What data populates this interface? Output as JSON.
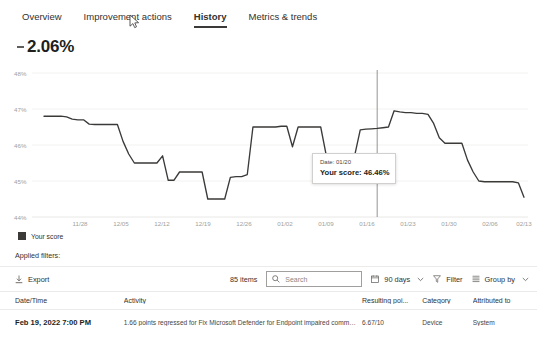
{
  "tabs": [
    {
      "label": "Overview",
      "active": false
    },
    {
      "label": "Improvement actions",
      "active": false
    },
    {
      "label": "History",
      "active": true
    },
    {
      "label": "Metrics & trends",
      "active": false
    }
  ],
  "headline": {
    "trend_icon": "decrease-dash-icon",
    "value": "2.06%"
  },
  "chart_data": {
    "type": "line",
    "title": "",
    "xlabel": "",
    "ylabel": "",
    "ylim": [
      44,
      48
    ],
    "yticks": [
      "44%",
      "45%",
      "46%",
      "47%",
      "48%"
    ],
    "grid": true,
    "legend_position": "bottom-left",
    "xticks": [
      "11/28",
      "12/05",
      "12/12",
      "12/19",
      "12/26",
      "01/02",
      "01/09",
      "01/16",
      "01/23",
      "01/30",
      "02/06",
      "02/13"
    ],
    "series": [
      {
        "name": "Your score",
        "color": "#3b3a39",
        "x": [
          "11/22",
          "11/23",
          "11/24",
          "11/25",
          "11/26",
          "11/27",
          "11/28",
          "11/29",
          "11/30",
          "12/01",
          "12/02",
          "12/03",
          "12/04",
          "12/05",
          "12/06",
          "12/07",
          "12/08",
          "12/09",
          "12/10",
          "12/11",
          "12/12",
          "12/13",
          "12/14",
          "12/15",
          "12/16",
          "12/17",
          "12/18",
          "12/19",
          "12/20",
          "12/21",
          "12/22",
          "12/23",
          "12/24",
          "12/25",
          "12/26",
          "12/27",
          "12/28",
          "12/29",
          "12/30",
          "12/31",
          "01/01",
          "01/02",
          "01/03",
          "01/04",
          "01/05",
          "01/06",
          "01/07",
          "01/08",
          "01/09",
          "01/10",
          "01/11",
          "01/12",
          "01/13",
          "01/14",
          "01/15",
          "01/16",
          "01/17",
          "01/18",
          "01/19",
          "01/20",
          "01/21",
          "01/22",
          "01/23",
          "01/24",
          "01/25",
          "01/26",
          "01/27",
          "01/28",
          "01/29",
          "01/30",
          "01/31",
          "02/01",
          "02/02",
          "02/03",
          "02/04",
          "02/05",
          "02/06",
          "02/07",
          "02/08",
          "02/09",
          "02/10",
          "02/11",
          "02/12",
          "02/13",
          "02/14",
          "02/15"
        ],
        "values": [
          46.8,
          46.8,
          46.8,
          46.8,
          46.78,
          46.72,
          46.7,
          46.7,
          46.58,
          46.57,
          46.57,
          46.57,
          46.57,
          46.57,
          46.1,
          45.75,
          45.5,
          45.5,
          45.5,
          45.5,
          45.5,
          45.7,
          45.02,
          45.02,
          45.25,
          45.25,
          45.25,
          45.25,
          45.25,
          44.5,
          44.5,
          44.5,
          44.5,
          45.1,
          45.12,
          45.12,
          45.18,
          46.5,
          46.5,
          46.5,
          46.5,
          46.5,
          46.52,
          46.52,
          45.95,
          46.5,
          46.5,
          46.5,
          46.5,
          46.5,
          45.7,
          45.7,
          45.7,
          45.7,
          45.7,
          45.7,
          46.42,
          46.44,
          46.45,
          46.46,
          46.48,
          46.5,
          46.95,
          46.92,
          46.9,
          46.9,
          46.88,
          46.88,
          46.85,
          46.6,
          46.2,
          46.05,
          46.05,
          46.05,
          46.05,
          45.58,
          45.25,
          45.0,
          44.98,
          44.98,
          44.98,
          44.98,
          44.98,
          44.98,
          44.95,
          44.55
        ]
      }
    ],
    "cursor": {
      "x_label": "01/20"
    },
    "tooltip": {
      "date_label": "Date: 01/20",
      "score_label": "Your score: 46.46%"
    },
    "legend": [
      {
        "label": "Your score",
        "color": "#3b3a39"
      }
    ]
  },
  "applied_filters": {
    "label": "Applied filters:"
  },
  "toolbar": {
    "export_label": "Export",
    "export_icon": "download-icon",
    "item_count": "85 items",
    "search_placeholder": "Search",
    "search_icon": "search-icon",
    "search_value": "",
    "date_range_label": "90 days",
    "date_range_icon": "calendar-icon",
    "filter_label": "Filter",
    "filter_icon": "funnel-icon",
    "group_by_label": "Group by",
    "group_by_icon": "list-icon",
    "chevron": "⌄"
  },
  "table": {
    "columns": [
      "Date/Time",
      "Activity",
      "Resulting poi...",
      "Category",
      "Attributed to"
    ],
    "rows": [
      {
        "datetime": "Feb 19, 2022 7:00 PM",
        "activity": "1.66 points regressed for Fix Microsoft Defender for Endpoint impaired communicatio...",
        "points": "6.67/10",
        "category": "Device",
        "attributed_to": "System"
      }
    ]
  }
}
